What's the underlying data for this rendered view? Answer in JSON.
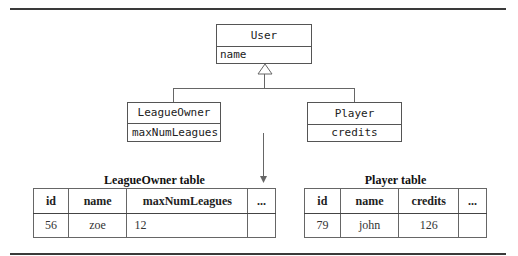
{
  "classes": {
    "user": {
      "name": "User",
      "attribute": "name"
    },
    "league_owner": {
      "name": "LeagueOwner",
      "attribute": "maxNumLeagues"
    },
    "player": {
      "name": "Player",
      "attribute": "credits"
    }
  },
  "tables": {
    "league_owner": {
      "title": "LeagueOwner table",
      "headers": [
        "id",
        "name",
        "maxNumLeagues",
        "..."
      ],
      "rows": [
        [
          "56",
          "zoe",
          "12",
          ""
        ]
      ]
    },
    "player": {
      "title": "Player table",
      "headers": [
        "id",
        "name",
        "credits",
        "..."
      ],
      "rows": [
        [
          "79",
          "john",
          "126",
          ""
        ]
      ]
    }
  },
  "icons": {
    "inheritance": "hollow-triangle-arrow",
    "mapping": "down-arrow"
  }
}
